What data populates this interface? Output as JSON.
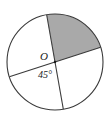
{
  "figure": {
    "type": "circle-sector-diagram",
    "center_label": "O",
    "angle_label": "45°",
    "angle_value": 45,
    "angle_unit": "degrees",
    "shaded_sector_label": "",
    "colors": {
      "shaded_fill": "#a9a9a9",
      "stroke": "#3a3a3a",
      "background": "#ffffff",
      "text": "#1a1a1a"
    },
    "geometry": {
      "center_x": 55,
      "center_y": 62,
      "radius": 48,
      "diameter_1_angle_deg": -18,
      "diameter_2_angle_deg": -100,
      "shaded_sector_start_deg": -100,
      "shaded_sector_end_deg": -18,
      "shaded_sector_sweep_deg": 82
    },
    "label_positions": {
      "center_x": 44,
      "center_y": 60,
      "angle_x": 45,
      "angle_y": 78
    }
  }
}
